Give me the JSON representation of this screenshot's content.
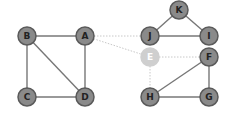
{
  "graph": {
    "colors": {
      "node_fill": "#8a8a8a",
      "node_stroke": "#5a5a5a",
      "edge": "#777777",
      "faded_node_fill": "#cfcfcf",
      "faded_edge": "#c8c8c8"
    },
    "nodes": [
      {
        "id": "A",
        "label": "A",
        "x": 85,
        "y": 36,
        "faded": false
      },
      {
        "id": "B",
        "label": "B",
        "x": 27,
        "y": 36,
        "faded": false
      },
      {
        "id": "C",
        "label": "C",
        "x": 27,
        "y": 97,
        "faded": false
      },
      {
        "id": "D",
        "label": "D",
        "x": 85,
        "y": 97,
        "faded": false
      },
      {
        "id": "K",
        "label": "K",
        "x": 179,
        "y": 10,
        "faded": false
      },
      {
        "id": "J",
        "label": "J",
        "x": 150,
        "y": 36,
        "faded": false
      },
      {
        "id": "I",
        "label": "I",
        "x": 209,
        "y": 36,
        "faded": false
      },
      {
        "id": "E",
        "label": "E",
        "x": 150,
        "y": 57,
        "faded": true
      },
      {
        "id": "F",
        "label": "F",
        "x": 209,
        "y": 57,
        "faded": false
      },
      {
        "id": "H",
        "label": "H",
        "x": 150,
        "y": 97,
        "faded": false
      },
      {
        "id": "G",
        "label": "G",
        "x": 209,
        "y": 97,
        "faded": false
      }
    ],
    "edges": [
      {
        "from": "B",
        "to": "A",
        "style": "solid"
      },
      {
        "from": "B",
        "to": "C",
        "style": "solid"
      },
      {
        "from": "B",
        "to": "D",
        "style": "solid"
      },
      {
        "from": "A",
        "to": "D",
        "style": "solid"
      },
      {
        "from": "C",
        "to": "D",
        "style": "solid"
      },
      {
        "from": "A",
        "to": "J",
        "style": "dotted"
      },
      {
        "from": "A",
        "to": "E",
        "style": "dotted"
      },
      {
        "from": "K",
        "to": "J",
        "style": "solid"
      },
      {
        "from": "K",
        "to": "I",
        "style": "solid"
      },
      {
        "from": "J",
        "to": "I",
        "style": "solid"
      },
      {
        "from": "E",
        "to": "F",
        "style": "dotted"
      },
      {
        "from": "E",
        "to": "H",
        "style": "dotted"
      },
      {
        "from": "F",
        "to": "H",
        "style": "solid"
      },
      {
        "from": "F",
        "to": "G",
        "style": "solid"
      },
      {
        "from": "H",
        "to": "G",
        "style": "solid"
      }
    ]
  }
}
